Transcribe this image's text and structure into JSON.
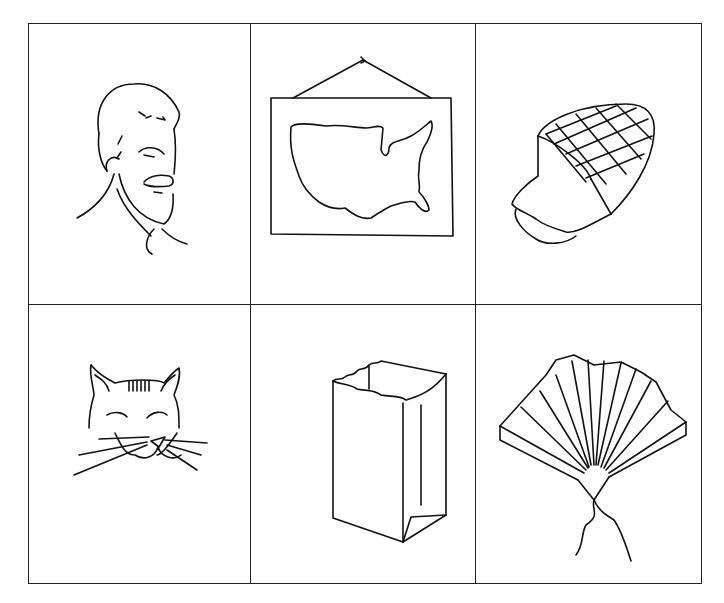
{
  "grid": {
    "rows": 2,
    "columns": 3,
    "line_color": "#222222",
    "background": "#ffffff",
    "cells": [
      {
        "row": 1,
        "col": 1,
        "picture": "man-face-with-mustache",
        "label": "man"
      },
      {
        "row": 1,
        "col": 2,
        "picture": "map-of-united-states-hanging",
        "label": "map"
      },
      {
        "row": 1,
        "col": 3,
        "picture": "sliced-ham",
        "label": "ham"
      },
      {
        "row": 2,
        "col": 1,
        "picture": "cat-face",
        "label": "cat"
      },
      {
        "row": 2,
        "col": 2,
        "picture": "paper-bag",
        "label": "bag"
      },
      {
        "row": 2,
        "col": 3,
        "picture": "folding-fan",
        "label": "fan"
      }
    ]
  }
}
